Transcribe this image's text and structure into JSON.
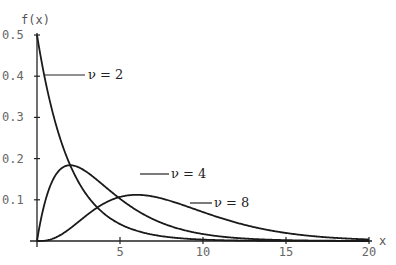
{
  "chart_data": {
    "type": "line",
    "title": "",
    "xlabel": "x",
    "ylabel": "f(x)",
    "xlim": [
      0,
      20
    ],
    "ylim": [
      0,
      0.5
    ],
    "grid": false,
    "x_ticks": [
      5,
      10,
      15,
      20
    ],
    "x_tick_labels": [
      "5",
      "10",
      "15",
      "20"
    ],
    "y_ticks": [
      0.1,
      0.2,
      0.3,
      0.4,
      0.5
    ],
    "y_tick_labels": [
      "0.1",
      "0.2",
      "0.3",
      "0.4",
      "0.5"
    ],
    "series": [
      {
        "name": "ν = 2",
        "dof": 2,
        "peak": {
          "x": 0,
          "y": 0.5
        }
      },
      {
        "name": "ν = 4",
        "dof": 4,
        "peak": {
          "x": 2,
          "y": 0.184
        }
      },
      {
        "name": "ν = 8",
        "dof": 8,
        "peak": {
          "x": 6,
          "y": 0.112
        }
      }
    ],
    "annotations": [
      {
        "text": "ν = 2",
        "series": 0
      },
      {
        "text": "ν = 4",
        "series": 1
      },
      {
        "text": "ν = 8",
        "series": 2
      }
    ]
  },
  "axes": {
    "x_title": "x",
    "y_title": "f(x)"
  }
}
